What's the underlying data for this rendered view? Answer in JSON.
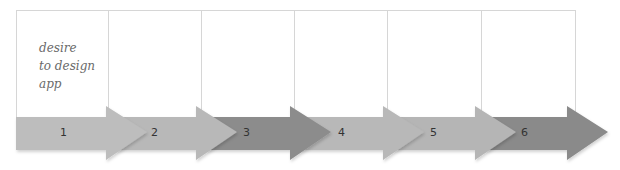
{
  "diagram": {
    "type": "process-arrow-timeline",
    "steps": [
      {
        "number": "1",
        "text": "desire\nto design\napp",
        "color": "#bdbdbd"
      },
      {
        "number": "2",
        "text": "",
        "color": "#b8b8b8"
      },
      {
        "number": "3",
        "text": "",
        "color": "#8c8c8c"
      },
      {
        "number": "4",
        "text": "",
        "color": "#b8b8b8"
      },
      {
        "number": "5",
        "text": "",
        "color": "#b5b5b5"
      },
      {
        "number": "6",
        "text": "",
        "color": "#8a8a8a"
      }
    ],
    "colors": {
      "box_border": "#d6d6d6",
      "text": "#6a6a6a",
      "number": "#333333"
    }
  }
}
